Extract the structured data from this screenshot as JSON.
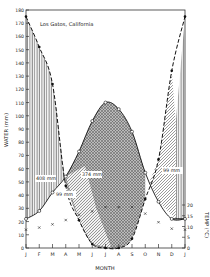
{
  "chart_data": {
    "type": "line",
    "title": "Los Gatos, California",
    "xlabel": "MONTH",
    "ylabel": "WATER (mm)",
    "ylabel_right": "TEMP (°C)",
    "categories": [
      "J",
      "F",
      "M",
      "A",
      "M",
      "J",
      "J",
      "A",
      "S",
      "O",
      "N",
      "D",
      "J"
    ],
    "ylim": [
      0,
      180
    ],
    "yticks": [
      0,
      10,
      20,
      30,
      40,
      50,
      60,
      70,
      80,
      90,
      100,
      110,
      120,
      130,
      140,
      150,
      160,
      170,
      180
    ],
    "ylim_right": [
      0,
      20
    ],
    "yticks_right": [
      0,
      5,
      10,
      15,
      20
    ],
    "series": [
      {
        "name": "Precipitation",
        "style": "dashed line, filled dots",
        "values": [
          175,
          152,
          124,
          47,
          21,
          3,
          0,
          0,
          7,
          37,
          67,
          134,
          175
        ]
      },
      {
        "name": "Potential evapotranspiration",
        "style": "solid line, open circles",
        "values": [
          22,
          28,
          42,
          54,
          73,
          96,
          110,
          105,
          88,
          57,
          35,
          22,
          22
        ]
      },
      {
        "name": "Temperature",
        "style": "x markers",
        "values": [
          8.5,
          9.5,
          11,
          13,
          15.5,
          17,
          19,
          19,
          19,
          16,
          12,
          9,
          8.5
        ]
      }
    ],
    "annotations": [
      {
        "label": "408 mm",
        "region": "surplus (winter)"
      },
      {
        "label": "374 mm",
        "region": "deficit (summer)"
      },
      {
        "label": "99 mm",
        "region": "soil moisture utilization"
      },
      {
        "label": "99 mm",
        "region": "soil moisture recharge"
      }
    ],
    "grid": false,
    "legend": "none"
  }
}
